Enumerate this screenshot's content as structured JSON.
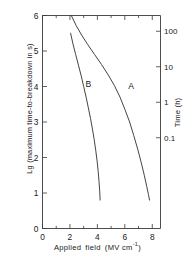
{
  "chart_data": {
    "type": "line",
    "title": "",
    "xlabel": "Applied field (MV cm⁻¹)",
    "ylabel": "Lg (maximum time-to-breakdown in s)",
    "y2label": "Time (h)",
    "xlim": [
      0,
      8.6
    ],
    "ylim": [
      0,
      6
    ],
    "grid": false,
    "legend_position": "inline-annotations",
    "xticks": [
      "0",
      "2",
      "4",
      "6",
      "8"
    ],
    "xtick_values": [
      0,
      2,
      4,
      6,
      8
    ],
    "xminor_values": [
      1,
      3,
      5,
      7
    ],
    "yticks": [
      "0",
      "1",
      "2",
      "3",
      "4",
      "5",
      "6"
    ],
    "ytick_values": [
      0,
      1,
      2,
      3,
      4,
      5,
      6
    ],
    "y2ticks": [
      "100",
      "10",
      "1",
      "0.1"
    ],
    "y2tick_lg_values": [
      5.556,
      4.556,
      3.556,
      2.556
    ],
    "series": [
      {
        "name": "A",
        "label": "A",
        "label_x": 6.45,
        "label_y": 3.92,
        "color": "#3a3a3a",
        "points": [
          [
            2.1,
            6.0
          ],
          [
            2.45,
            5.72
          ],
          [
            2.85,
            5.45
          ],
          [
            3.3,
            5.18
          ],
          [
            3.8,
            4.9
          ],
          [
            4.3,
            4.62
          ],
          [
            4.8,
            4.32
          ],
          [
            5.25,
            4.02
          ],
          [
            5.65,
            3.7
          ],
          [
            6.0,
            3.36
          ],
          [
            6.35,
            3.0
          ],
          [
            6.65,
            2.62
          ],
          [
            6.95,
            2.22
          ],
          [
            7.2,
            1.85
          ],
          [
            7.42,
            1.5
          ],
          [
            7.6,
            1.18
          ],
          [
            7.72,
            0.96
          ],
          [
            7.8,
            0.8
          ]
        ]
      },
      {
        "name": "B",
        "label": "B",
        "label_x": 3.35,
        "label_y": 3.98,
        "color": "#3a3a3a",
        "points": [
          [
            2.05,
            5.5
          ],
          [
            2.22,
            5.2
          ],
          [
            2.42,
            4.9
          ],
          [
            2.62,
            4.6
          ],
          [
            2.82,
            4.3
          ],
          [
            3.0,
            4.0
          ],
          [
            3.18,
            3.7
          ],
          [
            3.34,
            3.4
          ],
          [
            3.5,
            3.1
          ],
          [
            3.64,
            2.8
          ],
          [
            3.77,
            2.5
          ],
          [
            3.88,
            2.2
          ],
          [
            3.98,
            1.9
          ],
          [
            4.06,
            1.6
          ],
          [
            4.12,
            1.32
          ],
          [
            4.17,
            1.05
          ],
          [
            4.2,
            0.8
          ]
        ]
      }
    ]
  }
}
